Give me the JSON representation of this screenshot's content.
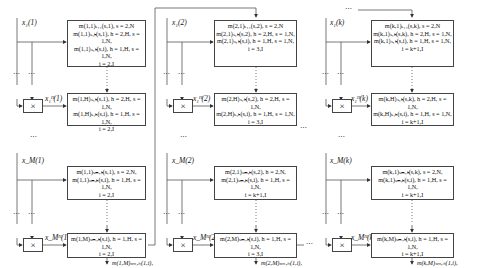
{
  "diagram": {
    "columns": [
      {
        "id": "col-1",
        "input_top": "x₁(1)",
        "input_bottom": "x_M(1)",
        "mul_top_out": "x₁ᴴ(1)",
        "mul_bottom_out": "x_Mᴴ(1)",
        "box_a": [
          "m(1,1)ₛ₁₁(s,1), s = 2,N",
          "m(1,1)ₛ₁ₕ(s,1), h = 2,H, s = 1,N,",
          "m(1,1)ₛ₁ₕ(s,i), h = 1,H, s = 1,N,",
          "i = 2,I"
        ],
        "box_b": [
          "m(1,H)ₛ₁ₕ(s,1), h = 2,H, s = 1,N,",
          "m(1,H)ₛ₁ₕ(s,i), h = 1,H, s = 1,N,",
          "i = 2,I"
        ],
        "box_c": [
          "m(1,1)ₛₘ,ₕ(s,1), s = 2,N,",
          "m(1,1)ₛₘ,ₕ(s,i), h = 1,H, s = 1,N,",
          "i = 2,I"
        ],
        "box_d": [
          "m(1,M)ₛₘ,ₕ(s,i), h = 1,H, s = 1,N,",
          "i = 2,I"
        ],
        "output": [
          "m(1,M)ₛₘ,ₕ(1,i),",
          "h = 1,H, i = 2,I"
        ]
      },
      {
        "id": "col-2",
        "input_top": "x₁(2)",
        "input_bottom": "x_M(2)",
        "mul_top_out": "x₁ᴴ(2)",
        "mul_bottom_out": "x_Mᴴ(2)",
        "box_a": [
          "m(2,1)ₛ₁₁(s,2), s = 2,N",
          "m(2,1)ₛ₁ₕ(s,2), h = 2,H, s = 1,N,",
          "m(2,1)ₛ₁ₕ(s,i), h = 1,H, s = 1,N,",
          "i = 3,I"
        ],
        "box_b": [
          "m(2,H)ₛ₁ₕ(s,2), h = 2,H, s = 1,N,",
          "m(2,H)ₛ₁ₕ(s,i), h = 1,H, s = 1,N,",
          "i = 3,I"
        ],
        "box_c": [
          "m(2,1)ₛₘ,ₕ(s,2), h = 2,N,",
          "m(2,1)ₛₘ,ₕ(s,i), h = 1,H, s = 1,N,",
          "i = k+1,I"
        ],
        "box_d": [
          "m(2,M)ₛₘ,ₕ(s,i), h = 1,H, s = 1,N,",
          "i = 3,I"
        ],
        "output": [
          "m(2,M)ₛₘ,ₕ(1,i),",
          "h = 1,H, i = 3,I"
        ]
      },
      {
        "id": "col-k",
        "input_top": "x₁(k)",
        "input_bottom": "x_M(k)",
        "mul_top_out": "x₁ᴴ(k)",
        "mul_bottom_out": "x_Mᴴ(k)",
        "box_a": [
          "m(k,1)ₛ₁₁(s,k), s = 2,N",
          "m(k,1)ₛ₁ₕ(s,k), h = 2,H, s = 1,N,",
          "m(k,1)ₛ₁ₕ(s,i), h = 1,H, s = 1,N,",
          "i = k+1,I"
        ],
        "box_b": [
          "m(k,H)ₛ₁ₕ(s,k), h = 2,H, s = 1,N,",
          "m(k,H)ₛ₁ₕ(s,i), h = 1,H, s = 1,N,",
          "i = k+1,I"
        ],
        "box_c": [
          "m(k,1)ₛₘ,ₕ(s,k), s = 2,N,",
          "m(k,1)ₛₘ,ₕ(s,i), h = 1,H, s = 1,N,",
          "i = k+1,I"
        ],
        "box_d": [
          "m(k,M)ₛₘ,ₕ(s,i), h = 1,H, s = 1,N,",
          "i = k+1,I"
        ],
        "output": [
          "m(k,M)ₛₘ,ₕ(1,i),",
          "h = 1,H, i = k+1,I"
        ]
      }
    ],
    "multiply_symbol": "×",
    "ellipsis": "⋯",
    "vdots": "⋮"
  }
}
